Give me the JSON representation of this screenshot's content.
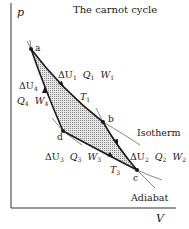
{
  "title": "The carnot cycle",
  "axes": {
    "y_label": "p",
    "x_label": "V"
  },
  "points": {
    "a": {
      "label": "a",
      "x": 31,
      "y": 49
    },
    "b": {
      "label": "b",
      "x": 103,
      "y": 122
    },
    "c": {
      "label": "c",
      "x": 137,
      "y": 170
    },
    "d": {
      "label": "d",
      "x": 63,
      "y": 131
    }
  },
  "processes": {
    "ab": {
      "du": "ΔU",
      "du_sub": "1",
      "q": "Q",
      "q_sub": "1",
      "w": "W",
      "w_sub": "1",
      "temp": "T",
      "temp_sub": "1"
    },
    "bc": {
      "du": "ΔU",
      "du_sub": "2",
      "q": "Q",
      "q_sub": "2",
      "w": "W",
      "w_sub": "2"
    },
    "cd": {
      "du": "ΔU",
      "du_sub": "3",
      "q": "Q",
      "q_sub": "3",
      "w": "W",
      "w_sub": "3",
      "temp": "T",
      "temp_sub": "3"
    },
    "da": {
      "du": "ΔU",
      "du_sub": "4",
      "q": "Q",
      "q_sub": "4",
      "w": "W",
      "w_sub": "4"
    }
  },
  "annotations": {
    "isotherm": "Isotherm",
    "adiabat": "Adiabat"
  },
  "colors": {
    "line": "#1a1a1a",
    "fill": "#c8c8c8",
    "thin": "#555555"
  }
}
